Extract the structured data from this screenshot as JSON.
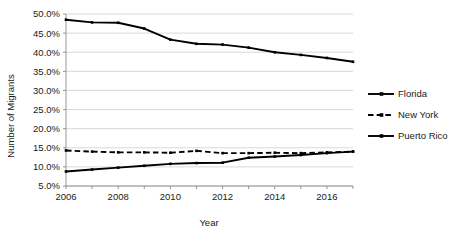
{
  "chart_data": {
    "type": "line",
    "title": "",
    "xlabel": "Year",
    "ylabel": "Number of Migrants",
    "x": [
      2006,
      2007,
      2008,
      2009,
      2010,
      2011,
      2012,
      2013,
      2014,
      2015,
      2016,
      2017
    ],
    "xlim": [
      2006,
      2017
    ],
    "ylim": [
      5,
      50
    ],
    "ytick_labels": [
      "5.0%",
      "10.0%",
      "15.0%",
      "20.0%",
      "25.0%",
      "30.0%",
      "35.0%",
      "40.0%",
      "45.0%",
      "50.0%"
    ],
    "ytick_values": [
      5,
      10,
      15,
      20,
      25,
      30,
      35,
      40,
      45,
      50
    ],
    "xtick_labels": [
      "2006",
      "2008",
      "2010",
      "2012",
      "2014",
      "2016"
    ],
    "xtick_values": [
      2006,
      2008,
      2010,
      2012,
      2014,
      2016
    ],
    "grid": "horizontal",
    "legend_position": "right",
    "series": [
      {
        "name": "Florida",
        "style": "solid",
        "color": "#000000",
        "values": [
          48.5,
          47.8,
          47.7,
          46.2,
          43.3,
          42.2,
          42.0,
          41.2,
          40.0,
          39.3,
          38.5,
          37.5
        ]
      },
      {
        "name": "New York",
        "style": "dashed",
        "color": "#000000",
        "values": [
          14.3,
          14.0,
          13.8,
          13.8,
          13.7,
          14.2,
          13.6,
          13.6,
          13.7,
          13.6,
          13.8,
          14.0
        ]
      },
      {
        "name": "Puerto Rico",
        "style": "solid",
        "color": "#000000",
        "values": [
          8.8,
          9.3,
          9.8,
          10.3,
          10.8,
          11.0,
          11.1,
          12.4,
          12.7,
          13.1,
          13.6,
          14.0
        ]
      }
    ]
  },
  "axis": {
    "y_title": "Number of Migrants",
    "x_title": "Year"
  },
  "legend": {
    "items": [
      {
        "label": "Florida"
      },
      {
        "label": "New York"
      },
      {
        "label": "Puerto Rico"
      }
    ]
  }
}
